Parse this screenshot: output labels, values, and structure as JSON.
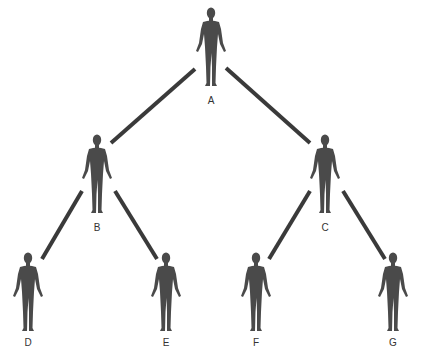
{
  "diagram": {
    "type": "tree",
    "colors": {
      "figure": "#4a4a4a",
      "edge": "#3a3a3a",
      "label": "#333333"
    },
    "nodes": [
      {
        "id": "A",
        "label": "A",
        "x": 211,
        "y": 7,
        "label_y": 95
      },
      {
        "id": "B",
        "label": "B",
        "x": 97,
        "y": 134,
        "label_y": 222
      },
      {
        "id": "C",
        "label": "C",
        "x": 325,
        "y": 134,
        "label_y": 222
      },
      {
        "id": "D",
        "label": "D",
        "x": 28,
        "y": 252,
        "label_y": 337
      },
      {
        "id": "E",
        "label": "E",
        "x": 166,
        "y": 252,
        "label_y": 337
      },
      {
        "id": "F",
        "label": "F",
        "x": 256,
        "y": 252,
        "label_y": 337
      },
      {
        "id": "G",
        "label": "G",
        "x": 393,
        "y": 252,
        "label_y": 337
      }
    ],
    "edges": [
      {
        "from": "A",
        "to": "B",
        "x1": 195,
        "y1": 69,
        "x2": 111,
        "y2": 143
      },
      {
        "from": "A",
        "to": "C",
        "x1": 226,
        "y1": 68,
        "x2": 310,
        "y2": 143
      },
      {
        "from": "B",
        "to": "D",
        "x1": 82,
        "y1": 191,
        "x2": 42,
        "y2": 259
      },
      {
        "from": "B",
        "to": "E",
        "x1": 115,
        "y1": 191,
        "x2": 157,
        "y2": 259
      },
      {
        "from": "C",
        "to": "F",
        "x1": 310,
        "y1": 191,
        "x2": 269,
        "y2": 259
      },
      {
        "from": "C",
        "to": "G",
        "x1": 343,
        "y1": 191,
        "x2": 385,
        "y2": 259
      }
    ]
  }
}
